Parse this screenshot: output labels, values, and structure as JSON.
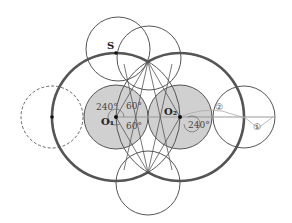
{
  "diagram": {
    "points": {
      "S": {
        "label": "S",
        "x": 116,
        "y": 53
      },
      "O1": {
        "label": "O₁",
        "x": 116,
        "y": 117
      },
      "O2": {
        "label": "O₂",
        "x": 180,
        "y": 117
      },
      "left_dot": {
        "x": 52,
        "y": 117
      }
    },
    "angles": {
      "o1_upper_left": "240°",
      "o1_upper_right": "60°",
      "o1_lower_right": "60°",
      "o2_lower_right": "240°"
    },
    "markers": {
      "one": "①",
      "two": "②"
    },
    "colors": {
      "fill_gray": "#d0d0d0",
      "stroke": "#444444",
      "thick_stroke": "#555555",
      "guide": "#aaaaaa"
    }
  }
}
